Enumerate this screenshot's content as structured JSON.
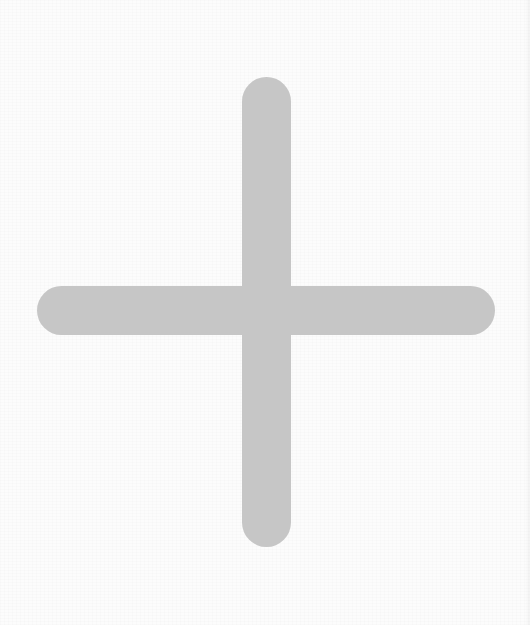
{
  "icon": {
    "name": "plus-icon",
    "semantic": "add",
    "color": "#c6c6c6"
  },
  "background": {
    "color": "#fcfcfc",
    "edge_strip_color": "#f0f0f0"
  }
}
